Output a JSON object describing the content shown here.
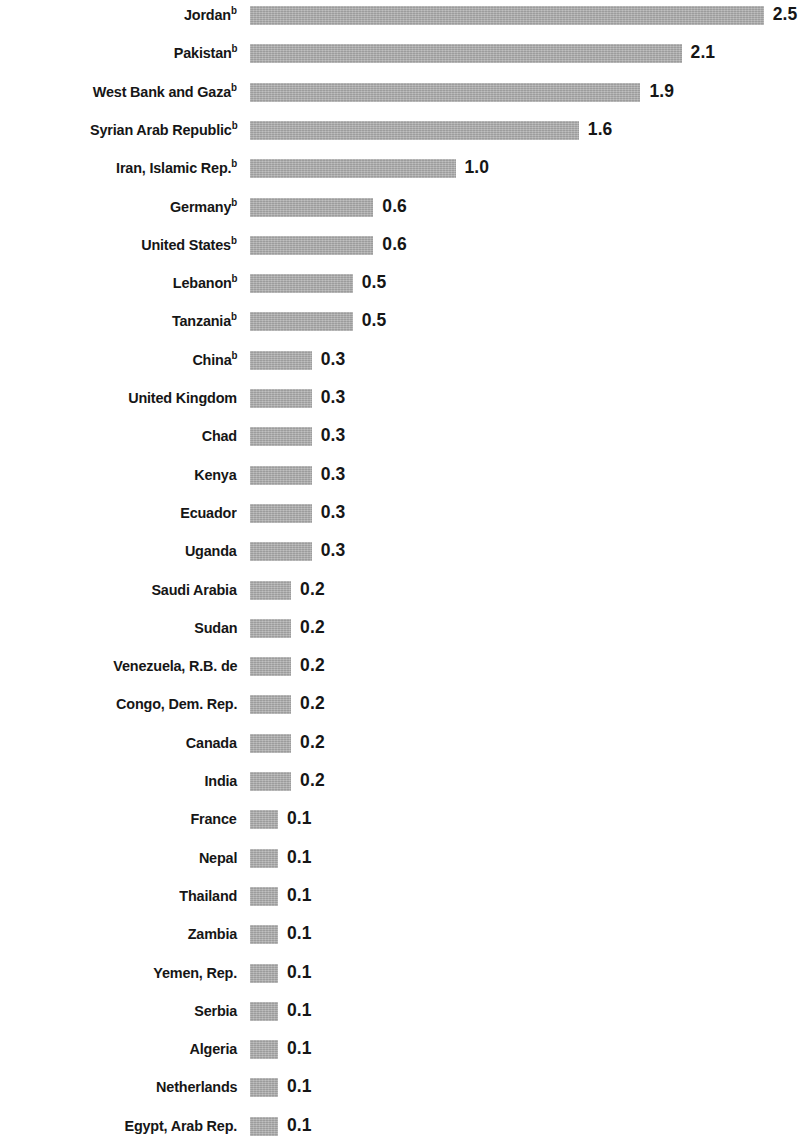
{
  "chart_data": {
    "type": "bar",
    "orientation": "horizontal",
    "title": "",
    "subtitle": "",
    "xlabel": "",
    "ylabel": "",
    "grid": false,
    "legend": null,
    "axis_visible": false,
    "value_labels_shown": true,
    "xlim": [
      0,
      2.5
    ],
    "bar_color": "#ababab",
    "text_color": "#161616",
    "background_color": "#ffffff",
    "footnote_marker": "b",
    "categories": [
      "Jordan",
      "Pakistan",
      "West Bank and Gaza",
      "Syrian Arab Republic",
      "Iran, Islamic Rep.",
      "Germany",
      "United States",
      "Lebanon",
      "Tanzania",
      "China",
      "United Kingdom",
      "Chad",
      "Kenya",
      "Ecuador",
      "Uganda",
      "Saudi Arabia",
      "Sudan",
      "Venezuela, R.B. de",
      "Congo, Dem. Rep.",
      "Canada",
      "India",
      "France",
      "Nepal",
      "Thailand",
      "Zambia",
      "Yemen, Rep.",
      "Serbia",
      "Algeria",
      "Netherlands",
      "Egypt, Arab Rep."
    ],
    "values": [
      2.5,
      2.1,
      1.9,
      1.6,
      1.0,
      0.6,
      0.6,
      0.5,
      0.5,
      0.3,
      0.3,
      0.3,
      0.3,
      0.3,
      0.3,
      0.2,
      0.2,
      0.2,
      0.2,
      0.2,
      0.2,
      0.1,
      0.1,
      0.1,
      0.1,
      0.1,
      0.1,
      0.1,
      0.1,
      0.1
    ],
    "value_labels": [
      "2.5",
      "2.1",
      "1.9",
      "1.6",
      "1.0",
      "0.6",
      "0.6",
      "0.5",
      "0.5",
      "0.3",
      "0.3",
      "0.3",
      "0.3",
      "0.3",
      "0.3",
      "0.2",
      "0.2",
      "0.2",
      "0.2",
      "0.2",
      "0.2",
      "0.1",
      "0.1",
      "0.1",
      "0.1",
      "0.1",
      "0.1",
      "0.1",
      "0.1",
      "0.1"
    ],
    "footnoted": [
      true,
      true,
      true,
      true,
      true,
      true,
      true,
      true,
      true,
      true,
      false,
      false,
      false,
      false,
      false,
      false,
      false,
      false,
      false,
      false,
      false,
      false,
      false,
      false,
      false,
      false,
      false,
      false,
      false,
      false
    ]
  },
  "rows": [
    {
      "label": "Jordan",
      "sup": "b",
      "value": 2.5,
      "value_label": "2.5"
    },
    {
      "label": "Pakistan",
      "sup": "b",
      "value": 2.1,
      "value_label": "2.1"
    },
    {
      "label": "West Bank and Gaza",
      "sup": "b",
      "value": 1.9,
      "value_label": "1.9"
    },
    {
      "label": "Syrian Arab Republic",
      "sup": "b",
      "value": 1.6,
      "value_label": "1.6"
    },
    {
      "label": "Iran, Islamic Rep.",
      "sup": "b",
      "value": 1.0,
      "value_label": "1.0"
    },
    {
      "label": "Germany",
      "sup": "b",
      "value": 0.6,
      "value_label": "0.6"
    },
    {
      "label": "United States",
      "sup": "b",
      "value": 0.6,
      "value_label": "0.6"
    },
    {
      "label": "Lebanon",
      "sup": "b",
      "value": 0.5,
      "value_label": "0.5"
    },
    {
      "label": "Tanzania",
      "sup": "b",
      "value": 0.5,
      "value_label": "0.5"
    },
    {
      "label": "China",
      "sup": "b",
      "value": 0.3,
      "value_label": "0.3"
    },
    {
      "label": "United Kingdom",
      "sup": "",
      "value": 0.3,
      "value_label": "0.3"
    },
    {
      "label": "Chad",
      "sup": "",
      "value": 0.3,
      "value_label": "0.3"
    },
    {
      "label": "Kenya",
      "sup": "",
      "value": 0.3,
      "value_label": "0.3"
    },
    {
      "label": "Ecuador",
      "sup": "",
      "value": 0.3,
      "value_label": "0.3"
    },
    {
      "label": "Uganda",
      "sup": "",
      "value": 0.3,
      "value_label": "0.3"
    },
    {
      "label": "Saudi Arabia",
      "sup": "",
      "value": 0.2,
      "value_label": "0.2"
    },
    {
      "label": "Sudan",
      "sup": "",
      "value": 0.2,
      "value_label": "0.2"
    },
    {
      "label": "Venezuela, R.B. de",
      "sup": "",
      "value": 0.2,
      "value_label": "0.2"
    },
    {
      "label": "Congo, Dem. Rep.",
      "sup": "",
      "value": 0.2,
      "value_label": "0.2"
    },
    {
      "label": "Canada",
      "sup": "",
      "value": 0.2,
      "value_label": "0.2"
    },
    {
      "label": "India",
      "sup": "",
      "value": 0.2,
      "value_label": "0.2"
    },
    {
      "label": "France",
      "sup": "",
      "value": 0.1,
      "value_label": "0.1"
    },
    {
      "label": "Nepal",
      "sup": "",
      "value": 0.1,
      "value_label": "0.1"
    },
    {
      "label": "Thailand",
      "sup": "",
      "value": 0.1,
      "value_label": "0.1"
    },
    {
      "label": "Zambia",
      "sup": "",
      "value": 0.1,
      "value_label": "0.1"
    },
    {
      "label": "Yemen, Rep.",
      "sup": "",
      "value": 0.1,
      "value_label": "0.1"
    },
    {
      "label": "Serbia",
      "sup": "",
      "value": 0.1,
      "value_label": "0.1"
    },
    {
      "label": "Algeria",
      "sup": "",
      "value": 0.1,
      "value_label": "0.1"
    },
    {
      "label": "Netherlands",
      "sup": "",
      "value": 0.1,
      "value_label": "0.1"
    },
    {
      "label": "Egypt, Arab Rep.",
      "sup": "",
      "value": 0.1,
      "value_label": "0.1"
    }
  ],
  "layout": {
    "row_pitch_px": 38.3,
    "first_row_top_px": 2,
    "bar_origin_x_px": 250,
    "px_per_unit": 205.5,
    "min_bar_px": 28,
    "bar_height_px": 19,
    "value_gap_px": 9
  }
}
